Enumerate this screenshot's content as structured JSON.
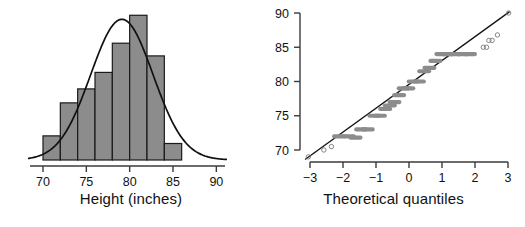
{
  "figure": {
    "title": "",
    "panels": [
      "histogram",
      "normal-qq-plot"
    ]
  },
  "chart_data": [
    {
      "type": "bar",
      "name": "height-histogram",
      "title": "",
      "xlabel": "Height (inches)",
      "ylabel": "",
      "xlim": [
        68.5,
        91.0
      ],
      "ylim": [
        0,
        0.115
      ],
      "grid": false,
      "legend": null,
      "xticks": [
        70,
        75,
        80,
        85,
        90
      ],
      "xtick_labels": [
        "70",
        "75",
        "80",
        "85",
        "90"
      ],
      "bin_edges": [
        70,
        72,
        74,
        76,
        78,
        80,
        82,
        84,
        86
      ],
      "categories": [
        "70-72",
        "72-74",
        "74-76",
        "76-78",
        "78-80",
        "80-82",
        "82-84",
        "84-86"
      ],
      "values": [
        0.019,
        0.045,
        0.056,
        0.069,
        0.092,
        0.114,
        0.082,
        0.013
      ],
      "overlay": {
        "type": "line",
        "name": "normal density curve",
        "mean": 79.1,
        "sd": 3.6,
        "peak_x": 79.1,
        "peak_y": 0.1108
      }
    },
    {
      "type": "scatter",
      "name": "normal-qq-plot",
      "title": "",
      "xlabel": "Theoretical quantiles",
      "ylabel": "",
      "xlim": [
        -3.25,
        3.25
      ],
      "ylim": [
        68.2,
        90.6
      ],
      "grid": false,
      "legend": null,
      "xticks": [
        -3,
        -2,
        -1,
        0,
        1,
        2,
        3
      ],
      "xtick_labels": [
        "−3",
        "−2",
        "−1",
        "0",
        "1",
        "2",
        "3"
      ],
      "yticks": [
        70,
        75,
        80,
        85,
        90
      ],
      "ytick_labels": [
        "70",
        "75",
        "80",
        "85",
        "90"
      ],
      "reference_line": {
        "name": "qq-reference-line",
        "x": [
          -3.15,
          3.05
        ],
        "y": [
          68.6,
          90.2
        ]
      },
      "points": [
        {
          "x": -3.05,
          "y": 69.0,
          "style": "open"
        },
        {
          "x": -2.58,
          "y": 70.0,
          "style": "open"
        },
        {
          "x": -2.35,
          "y": 70.5,
          "style": "open"
        },
        {
          "x": -2.12,
          "y": 72.0,
          "style": "dash"
        },
        {
          "x": -1.82,
          "y": 72.0,
          "style": "dash"
        },
        {
          "x": -1.62,
          "y": 71.8,
          "style": "dash"
        },
        {
          "x": -1.45,
          "y": 73.0,
          "style": "dash"
        },
        {
          "x": -1.25,
          "y": 73.0,
          "style": "dash"
        },
        {
          "x": -1.05,
          "y": 75.0,
          "style": "dash"
        },
        {
          "x": -0.88,
          "y": 75.0,
          "style": "dash"
        },
        {
          "x": -0.72,
          "y": 76.0,
          "style": "dash"
        },
        {
          "x": -0.58,
          "y": 76.5,
          "style": "dash"
        },
        {
          "x": -0.44,
          "y": 77.0,
          "style": "dash"
        },
        {
          "x": -0.3,
          "y": 78.0,
          "style": "dash"
        },
        {
          "x": -0.16,
          "y": 79.0,
          "style": "dash"
        },
        {
          "x": -0.02,
          "y": 79.0,
          "style": "dash"
        },
        {
          "x": 0.14,
          "y": 80.0,
          "style": "dash"
        },
        {
          "x": 0.3,
          "y": 80.0,
          "style": "dash"
        },
        {
          "x": 0.46,
          "y": 81.5,
          "style": "dash"
        },
        {
          "x": 0.62,
          "y": 82.0,
          "style": "dash"
        },
        {
          "x": 0.8,
          "y": 83.0,
          "style": "dash"
        },
        {
          "x": 0.98,
          "y": 84.0,
          "style": "dash"
        },
        {
          "x": 1.18,
          "y": 84.0,
          "style": "dash"
        },
        {
          "x": 1.4,
          "y": 84.0,
          "style": "dash"
        },
        {
          "x": 1.62,
          "y": 84.0,
          "style": "dash"
        },
        {
          "x": 1.85,
          "y": 84.0,
          "style": "dash"
        },
        {
          "x": 2.25,
          "y": 85.0,
          "style": "open"
        },
        {
          "x": 2.35,
          "y": 85.0,
          "style": "open"
        },
        {
          "x": 2.42,
          "y": 86.0,
          "style": "open"
        },
        {
          "x": 2.52,
          "y": 86.0,
          "style": "open"
        },
        {
          "x": 2.68,
          "y": 86.8,
          "style": "open"
        },
        {
          "x": 3.02,
          "y": 90.0,
          "style": "open"
        }
      ]
    }
  ],
  "colors": {
    "bar_fill": "#8c8c8c",
    "bar_stroke": "#1a1a1a",
    "curve": "#111111",
    "axis": "#3b3b3b",
    "point_gray": "#8c8c8c",
    "point_open": "#777777",
    "background": "#ffffff"
  },
  "labels": {
    "hist_xaxis": "Height (inches)",
    "qq_xaxis": "Theoretical quantiles"
  }
}
